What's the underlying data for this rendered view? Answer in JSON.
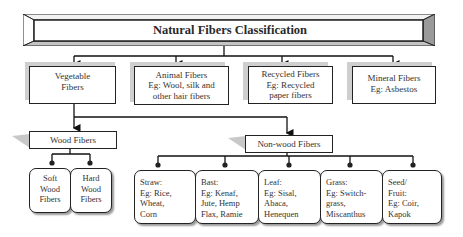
{
  "diagram": {
    "title": "Natural Fibers Classification",
    "level1": [
      {
        "id": "vegetable",
        "label": "Vegetable\nFibers"
      },
      {
        "id": "animal",
        "label": "Animal Fibers\nEg: Wool, silk and\nother hair fibers"
      },
      {
        "id": "recycled",
        "label": "Recycled Fibers\nEg: Recycled\npaper fibers"
      },
      {
        "id": "mineral",
        "label": "Mineral Fibers\nEg: Asbestos"
      }
    ],
    "level2": [
      {
        "id": "wood",
        "label": "Wood Fibers",
        "parent": "vegetable"
      },
      {
        "id": "nonwood",
        "label": "Non-wood Fibers",
        "parent": "vegetable"
      }
    ],
    "wood_children": [
      {
        "label": "Soft\nWood\nFibers"
      },
      {
        "label": "Hard\nWood\nFibers"
      }
    ],
    "nonwood_children": [
      {
        "label": "Straw:\nEg: Rice,\nWheat,\nCorn"
      },
      {
        "label": "Bast:\nEg: Kenaf,\nJute, Hemp\nFlax, Ramie"
      },
      {
        "label": "Leaf:\nEg: Sisal,\nAbaca,\nHenequen"
      },
      {
        "label": "Grass:\nEg: Switch-\ngrass,\nMiscanthus"
      },
      {
        "label": "Seed/\nFruit:\nEg: Coir,\nKapok"
      }
    ]
  }
}
